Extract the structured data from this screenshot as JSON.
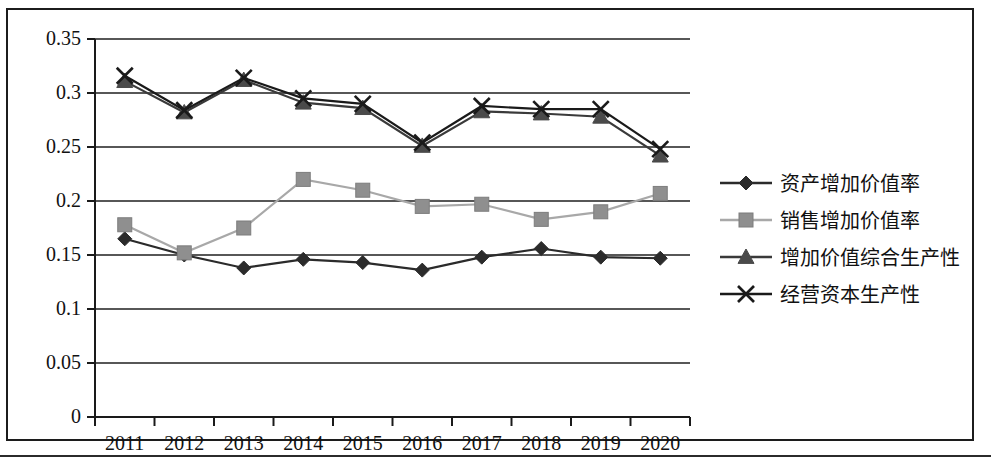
{
  "chart_data": {
    "type": "line",
    "title": "",
    "subtitle": "",
    "xlabel": "",
    "ylabel": "",
    "categories": [
      "2011",
      "2012",
      "2013",
      "2014",
      "2015",
      "2016",
      "2017",
      "2018",
      "2019",
      "2020"
    ],
    "ylim": [
      0,
      0.35
    ],
    "ytick_labels": [
      "0",
      "0.05",
      "0.1",
      "0.15",
      "0.2",
      "0.25",
      "0.3",
      "0.35"
    ],
    "ytick_values": [
      0,
      0.05,
      0.1,
      0.15,
      0.2,
      0.25,
      0.3,
      0.35
    ],
    "grid": "horizontal",
    "legend_position": "right",
    "series": [
      {
        "name": "资产增加价值率",
        "marker": "diamond",
        "color": "#2b2b2b",
        "line_color": "#2b2b2b",
        "values": [
          0.165,
          0.15,
          0.138,
          0.146,
          0.143,
          0.136,
          0.148,
          0.156,
          0.148,
          0.147
        ]
      },
      {
        "name": "销售增加价值率",
        "marker": "square",
        "color": "#8f8f8f",
        "line_color": "#a8a8a8",
        "values": [
          0.178,
          0.152,
          0.175,
          0.22,
          0.21,
          0.195,
          0.197,
          0.183,
          0.19,
          0.207
        ]
      },
      {
        "name": "增加价值综合生产性",
        "marker": "triangle",
        "color": "#4a4a4a",
        "line_color": "#3a3a3a",
        "values": [
          0.311,
          0.282,
          0.312,
          0.291,
          0.286,
          0.251,
          0.283,
          0.281,
          0.278,
          0.242
        ]
      },
      {
        "name": "经营资本生产性",
        "marker": "cross",
        "color": "#1a1a1a",
        "line_color": "#1a1a1a",
        "values": [
          0.316,
          0.284,
          0.314,
          0.295,
          0.29,
          0.254,
          0.288,
          0.285,
          0.285,
          0.248
        ]
      }
    ]
  },
  "axis": {
    "y_labels": [
      "0.35",
      "0.3",
      "0.25",
      "0.2",
      "0.15",
      "0.1",
      "0.05",
      "0"
    ],
    "x_labels": [
      "2011",
      "2012",
      "2013",
      "2014",
      "2015",
      "2016",
      "2017",
      "2018",
      "2019",
      "2020"
    ]
  },
  "legend": {
    "items": [
      {
        "label": "资产增加价值率",
        "marker": "diamond-marker"
      },
      {
        "label": "销售增加价值率",
        "marker": "square-marker"
      },
      {
        "label": "增加价值综合生产性",
        "marker": "triangle-marker"
      },
      {
        "label": "经营资本生产性",
        "marker": "cross-marker"
      }
    ]
  }
}
